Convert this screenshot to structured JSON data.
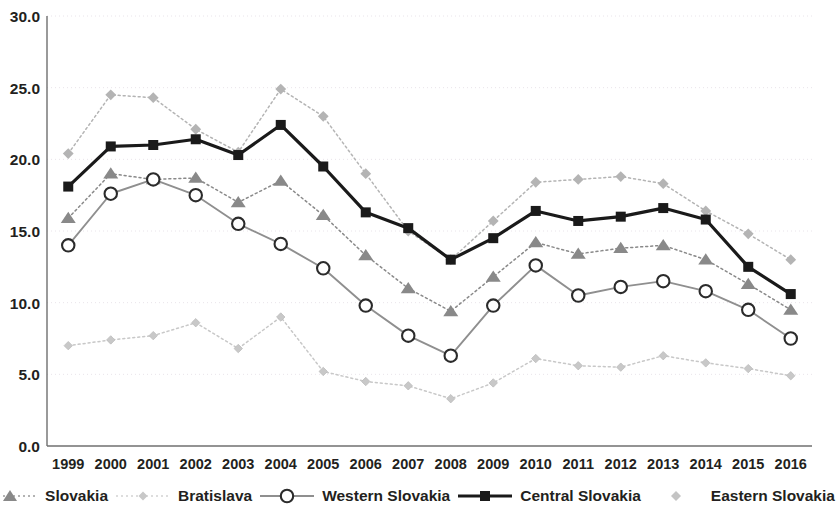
{
  "chart_data": {
    "type": "line",
    "title": "",
    "xlabel": "",
    "ylabel": "",
    "categories": [
      "1999",
      "2000",
      "2001",
      "2002",
      "2003",
      "2004",
      "2005",
      "2006",
      "2007",
      "2008",
      "2009",
      "2010",
      "2011",
      "2012",
      "2013",
      "2014",
      "2015",
      "2016"
    ],
    "ylim": [
      0,
      30
    ],
    "ytick_labels": [
      "0.0",
      "5.0",
      "10.0",
      "15.0",
      "20.0",
      "25.0",
      "30.0"
    ],
    "ytick_values": [
      0,
      5,
      10,
      15,
      20,
      25,
      30
    ],
    "grid": true,
    "legend_position": "bottom",
    "series": [
      {
        "name": "Slovakia",
        "marker": "triangle",
        "line_style": "dotted",
        "color": "#898989",
        "values": [
          15.9,
          19.0,
          18.6,
          18.7,
          17.0,
          18.5,
          16.1,
          13.3,
          11.0,
          9.4,
          11.8,
          14.2,
          13.4,
          13.8,
          14.0,
          13.0,
          11.3,
          9.5
        ]
      },
      {
        "name": "Bratislava",
        "marker": "small-diamond",
        "line_style": "dotted",
        "color": "#c8c8c8",
        "values": [
          7.0,
          7.4,
          7.7,
          8.6,
          6.8,
          9.0,
          5.2,
          4.5,
          4.2,
          3.3,
          4.4,
          6.1,
          5.6,
          5.5,
          6.3,
          5.8,
          5.4,
          4.9
        ]
      },
      {
        "name": "Western Slovakia",
        "marker": "open-circle",
        "line_style": "solid",
        "color": "#8c8c8c",
        "values": [
          14.0,
          17.6,
          18.6,
          17.5,
          15.5,
          14.1,
          12.4,
          9.8,
          7.7,
          6.3,
          9.8,
          12.6,
          10.5,
          11.1,
          11.5,
          10.8,
          9.5,
          7.5
        ]
      },
      {
        "name": "Central Slovakia",
        "marker": "filled-square",
        "line_style": "solid-bold",
        "color": "#1a1a1a",
        "values": [
          18.1,
          20.9,
          21.0,
          21.4,
          20.3,
          22.4,
          19.5,
          16.3,
          15.2,
          13.0,
          14.5,
          16.4,
          15.7,
          16.0,
          16.6,
          15.8,
          12.5,
          10.6
        ]
      },
      {
        "name": "Eastern Slovakia",
        "marker": "light-square",
        "line_style": "dotted",
        "color": "#b4b4b4",
        "values": [
          20.4,
          24.5,
          24.3,
          22.1,
          20.5,
          24.9,
          23.0,
          19.0,
          15.0,
          13.0,
          15.7,
          18.4,
          18.6,
          18.8,
          18.3,
          16.4,
          14.8,
          13.0
        ]
      }
    ]
  },
  "legend": {
    "items": [
      {
        "label": "Slovakia",
        "marker": "triangle-icon"
      },
      {
        "label": "Bratislava",
        "marker": "small-diamond-icon"
      },
      {
        "label": "Western Slovakia",
        "marker": "open-circle-icon"
      },
      {
        "label": "Central Slovakia",
        "marker": "filled-square-icon"
      },
      {
        "label": "Eastern Slovakia",
        "marker": "light-square-icon"
      }
    ]
  }
}
